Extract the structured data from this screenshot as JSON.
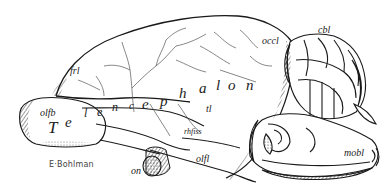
{
  "figure": {
    "title_word": {
      "letters": [
        "T",
        "e",
        "l",
        "e",
        "n",
        "c",
        "e",
        "p",
        "h",
        "a",
        "l",
        "o",
        "n"
      ],
      "full": "Telencephalon"
    },
    "labels": {
      "frl": "frl",
      "occl": "occl",
      "cbl": "cbl",
      "olfb": "olfb",
      "tl": "tl",
      "rhfiss": "rhfiss",
      "olfl": "olfl",
      "on": "on",
      "mobl": "mobl"
    },
    "signature": "E·Bohlman",
    "colors": {
      "ink": "#1a1a1a",
      "background": "#ffffff",
      "vessel": "#555555"
    }
  }
}
